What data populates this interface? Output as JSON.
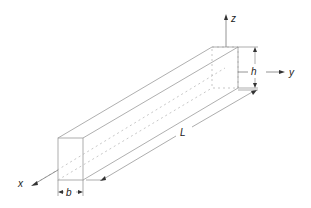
{
  "diagram": {
    "type": "beam-schematic",
    "labels": {
      "z_axis": "z",
      "y_axis": "y",
      "x_axis": "x",
      "height": "h",
      "width": "b",
      "length": "L"
    },
    "colors": {
      "edge": "#9a9a9a",
      "label": "#222222",
      "arrow": "#333333"
    }
  }
}
